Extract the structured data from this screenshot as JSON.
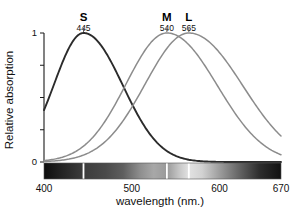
{
  "chart_data": {
    "type": "line",
    "title": "",
    "xlabel": "wavelength (nm.)",
    "ylabel": "Relative absorption",
    "xlim": [
      400,
      670
    ],
    "ylim": [
      0,
      1
    ],
    "grid": false,
    "legend_position": "inline-above-peaks",
    "xticks": [
      {
        "value": 400,
        "label": "400"
      },
      {
        "value": 500,
        "label": "500"
      },
      {
        "value": 600,
        "label": "600"
      },
      {
        "value": 670,
        "label": "670"
      }
    ],
    "yticks": [
      {
        "value": 0,
        "label": "0"
      },
      {
        "value": 0.25,
        "label": ""
      },
      {
        "value": 0.5,
        "label": ""
      },
      {
        "value": 0.75,
        "label": ""
      },
      {
        "value": 1,
        "label": "1"
      }
    ],
    "series": [
      {
        "name": "S",
        "label": "S",
        "peak_label": "445",
        "peak_nm": 445,
        "peak_value": 1,
        "color": "#2b2b2b",
        "width_nm": 45,
        "skew": 1.35,
        "x": [
          400,
          410,
          420,
          430,
          440,
          445,
          450,
          460,
          470,
          480,
          490,
          500,
          510,
          520,
          530,
          540,
          550,
          560,
          570,
          580
        ],
        "values": [
          0.1,
          0.28,
          0.58,
          0.88,
          0.99,
          1.0,
          0.99,
          0.9,
          0.72,
          0.5,
          0.31,
          0.17,
          0.09,
          0.05,
          0.03,
          0.015,
          0.008,
          0.004,
          0.002,
          0.001
        ]
      },
      {
        "name": "M",
        "label": "M",
        "peak_label": "540",
        "peak_nm": 540,
        "peak_value": 1,
        "color": "#8c8c8c",
        "width_nm": 58,
        "skew": 1.25,
        "x": [
          400,
          420,
          440,
          460,
          480,
          500,
          520,
          540,
          560,
          580,
          600,
          620,
          640,
          660,
          670
        ],
        "values": [
          0.03,
          0.07,
          0.14,
          0.26,
          0.44,
          0.67,
          0.9,
          1.0,
          0.93,
          0.72,
          0.46,
          0.24,
          0.1,
          0.035,
          0.02
        ]
      },
      {
        "name": "L",
        "label": "L",
        "peak_label": "565",
        "peak_nm": 565,
        "peak_value": 1,
        "color": "#8c8c8c",
        "width_nm": 62,
        "skew": 1.25,
        "x": [
          400,
          420,
          440,
          460,
          480,
          500,
          520,
          540,
          560,
          565,
          580,
          600,
          620,
          640,
          660,
          670
        ],
        "values": [
          0.02,
          0.05,
          0.1,
          0.19,
          0.32,
          0.5,
          0.71,
          0.91,
          1.0,
          1.0,
          0.95,
          0.77,
          0.52,
          0.28,
          0.11,
          0.07
        ]
      }
    ],
    "spectrum_bar": {
      "name": "visible-spectrum-bar",
      "from_nm": 400,
      "to_nm": 670,
      "separators_nm": [
        445,
        540,
        565
      ],
      "separator_color": "#ffffff",
      "gradient_stops": [
        {
          "nm": 400,
          "color": "#0d0d0d"
        },
        {
          "nm": 420,
          "color": "#232323"
        },
        {
          "nm": 445,
          "color": "#3c3c3c"
        },
        {
          "nm": 470,
          "color": "#4a4a4a"
        },
        {
          "nm": 490,
          "color": "#5e5e5e"
        },
        {
          "nm": 510,
          "color": "#8f8f8f"
        },
        {
          "nm": 525,
          "color": "#a8a8a8"
        },
        {
          "nm": 540,
          "color": "#9a9a9a"
        },
        {
          "nm": 555,
          "color": "#c9c9c9"
        },
        {
          "nm": 565,
          "color": "#e2e2e2"
        },
        {
          "nm": 580,
          "color": "#d2d2d2"
        },
        {
          "nm": 600,
          "color": "#9d9d9d"
        },
        {
          "nm": 620,
          "color": "#6a6a6a"
        },
        {
          "nm": 645,
          "color": "#2e2e2e"
        },
        {
          "nm": 670,
          "color": "#111111"
        }
      ]
    }
  }
}
